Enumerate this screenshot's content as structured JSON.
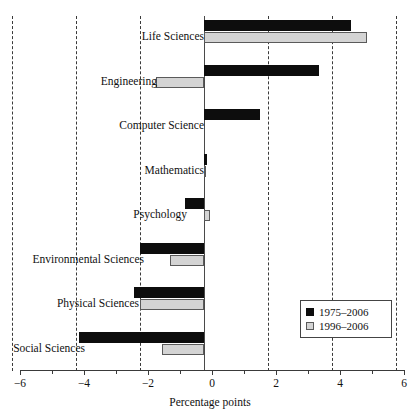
{
  "chart_data": {
    "type": "bar",
    "orientation": "horizontal",
    "title": "",
    "xlabel": "Percentage points",
    "ylabel": "",
    "xlim": [
      -6,
      6
    ],
    "xticks": [
      -6,
      -4,
      -2,
      0,
      2,
      4,
      6
    ],
    "xtick_labels": [
      "−6",
      "−4",
      "−2",
      "0",
      "2",
      "4",
      "6"
    ],
    "xminor_ticks": [
      -5,
      -3,
      -1,
      1,
      3,
      5
    ],
    "grid": "vertical dashed gridlines at major ticks",
    "legend_position": "lower right inside plot",
    "categories": [
      "Life Sciences",
      "Engineering",
      "Computer Science",
      "Mathematics",
      "Psychology",
      "Environmental Sciences",
      "Physical Sciences",
      "Social Sciences"
    ],
    "series": [
      {
        "name": "1975–2006",
        "color": "#0d0d0d",
        "values": [
          4.6,
          3.6,
          1.75,
          0.1,
          -0.6,
          -2.0,
          -2.2,
          -3.9
        ]
      },
      {
        "name": "1996–2006",
        "color": "#d4d4d4",
        "values": [
          5.1,
          -1.5,
          0.0,
          0.05,
          0.2,
          -1.05,
          -2.0,
          -1.3
        ]
      }
    ]
  },
  "axis": {
    "title": "Percentage points"
  },
  "legend": {
    "entries": [
      {
        "label": "1975–2006",
        "swatch": "dark"
      },
      {
        "label": "1996–2006",
        "swatch": "light"
      }
    ]
  }
}
